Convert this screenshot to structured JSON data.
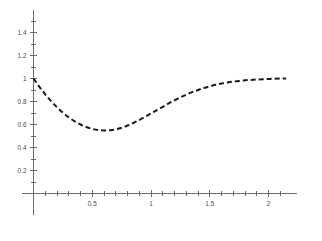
{
  "chart_data": {
    "type": "line",
    "title": "",
    "subtitle": "",
    "xlabel": "",
    "ylabel": "",
    "xlim": [
      -0.04,
      2.16
    ],
    "ylim": [
      -0.1,
      1.54
    ],
    "grid": false,
    "legend": null,
    "line_style": "dashed",
    "line_color": "#1a1a1a",
    "axis_color": "#6b6b6b",
    "x_ticks_major": [
      0.5,
      1,
      1.5,
      2
    ],
    "x_tick_labels": [
      "0.5",
      "1",
      "1.5",
      "2"
    ],
    "x_ticks_minor": [
      0.1,
      0.2,
      0.3,
      0.4,
      0.6,
      0.7,
      0.8,
      0.9,
      1.1,
      1.2,
      1.3,
      1.4,
      1.6,
      1.7,
      1.8,
      1.9,
      2.1
    ],
    "y_ticks_major": [
      0.2,
      0.4,
      0.6,
      0.8,
      1,
      1.2,
      1.4
    ],
    "y_tick_labels": [
      "0.2",
      "0.4",
      "0.6",
      "0.8",
      "1",
      "1.2",
      "1.4"
    ],
    "y_ticks_minor": [
      0.1,
      0.3,
      0.5,
      0.7,
      0.9,
      1.1,
      1.3,
      1.5
    ],
    "x": [
      0,
      0.05,
      0.1,
      0.15,
      0.2,
      0.25,
      0.3,
      0.35,
      0.4,
      0.45,
      0.5,
      0.55,
      0.6,
      0.65,
      0.7,
      0.75,
      0.8,
      0.85,
      0.9,
      0.95,
      1,
      1.05,
      1.1,
      1.15,
      1.2,
      1.25,
      1.3,
      1.35,
      1.4,
      1.45,
      1.5,
      1.55,
      1.6,
      1.65,
      1.7,
      1.75,
      1.8,
      1.85,
      1.9,
      1.95,
      2,
      2.05,
      2.1,
      2.15
    ],
    "y": [
      1,
      0.928,
      0.862,
      0.803,
      0.75,
      0.703,
      0.662,
      0.628,
      0.6,
      0.578,
      0.562,
      0.552,
      0.548,
      0.55,
      0.558,
      0.572,
      0.591,
      0.613,
      0.639,
      0.667,
      0.696,
      0.725,
      0.754,
      0.783,
      0.81,
      0.836,
      0.86,
      0.881,
      0.9,
      0.917,
      0.932,
      0.945,
      0.956,
      0.965,
      0.973,
      0.979,
      0.984,
      0.988,
      0.991,
      0.994,
      0.996,
      0.998,
      0.999,
      1
    ],
    "annotations": []
  },
  "axes": {
    "y_axis_name": "vertical-axis",
    "x_axis_name": "horizontal-axis"
  }
}
